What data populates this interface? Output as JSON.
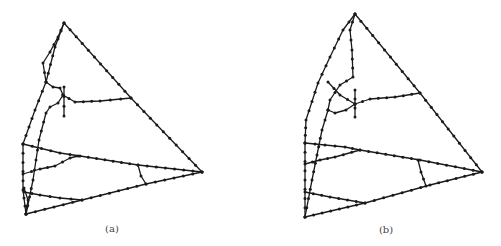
{
  "figure": {
    "panels": [
      {
        "id": "a",
        "caption": "(a)",
        "description": "Road network graph with nodes on a triangular outline"
      },
      {
        "id": "b",
        "caption": "(b)",
        "description": "Same road network graph after transformation"
      }
    ]
  }
}
